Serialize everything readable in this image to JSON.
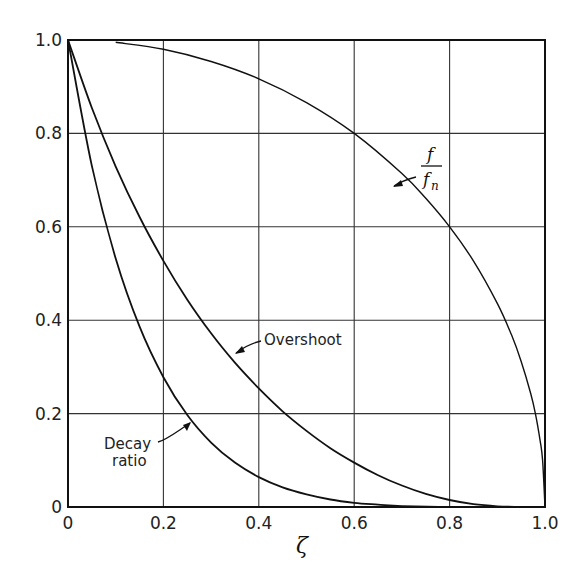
{
  "chart_data": {
    "type": "line",
    "title": "",
    "xlabel": "ζ",
    "ylabel": "",
    "xlim": [
      0,
      1.0
    ],
    "ylim": [
      0,
      1.0
    ],
    "grid": true,
    "x_ticks": [
      "0",
      "0.2",
      "0.4",
      "0.6",
      "0.8",
      "1.0"
    ],
    "y_ticks": [
      "0",
      "0.2",
      "0.4",
      "0.6",
      "0.8",
      "1.0"
    ],
    "series": [
      {
        "name": "f/f_n",
        "x": [
          0.1,
          0.2,
          0.3,
          0.4,
          0.5,
          0.6,
          0.7,
          0.75,
          0.8,
          0.85,
          0.9,
          0.93,
          0.95,
          0.97,
          0.98,
          0.99,
          0.995,
          1.0
        ],
        "values": [
          0.995,
          0.98,
          0.954,
          0.917,
          0.866,
          0.8,
          0.714,
          0.661,
          0.6,
          0.527,
          0.436,
          0.368,
          0.312,
          0.243,
          0.199,
          0.141,
          0.1,
          0.0
        ]
      },
      {
        "name": "Overshoot",
        "x": [
          0,
          0.05,
          0.1,
          0.15,
          0.2,
          0.25,
          0.3,
          0.35,
          0.4,
          0.45,
          0.5,
          0.55,
          0.6,
          0.65,
          0.7,
          0.75,
          0.8,
          0.85,
          0.9,
          0.95,
          1.0
        ],
        "values": [
          1.0,
          0.855,
          0.729,
          0.621,
          0.527,
          0.444,
          0.372,
          0.309,
          0.254,
          0.205,
          0.163,
          0.126,
          0.095,
          0.068,
          0.046,
          0.028,
          0.015,
          0.006,
          0.0015,
          0.0001,
          0.0
        ]
      },
      {
        "name": "Decay ratio",
        "x": [
          0,
          0.05,
          0.1,
          0.15,
          0.2,
          0.25,
          0.3,
          0.35,
          0.4,
          0.45,
          0.5,
          0.55,
          0.6,
          0.65,
          0.7,
          0.8,
          0.9,
          1.0
        ],
        "values": [
          1.0,
          0.731,
          0.532,
          0.386,
          0.278,
          0.197,
          0.138,
          0.095,
          0.064,
          0.042,
          0.027,
          0.016,
          0.009,
          0.005,
          0.002,
          0.0002,
          0.0,
          0.0
        ]
      }
    ],
    "annotations": [
      {
        "label": "f",
        "sub": "n",
        "target_series": "f/f_n",
        "at_x": 0.61
      },
      {
        "label": "Overshoot",
        "target_series": "Overshoot",
        "at_x": 0.36
      },
      {
        "label_lines": [
          "Decay",
          "ratio"
        ],
        "target_series": "Decay ratio",
        "at_x": 0.26
      }
    ]
  },
  "labels": {
    "x_axis": "ζ",
    "overshoot": "Overshoot",
    "decay_line1": "Decay",
    "decay_line2": "ratio",
    "ffn_num": "f",
    "ffn_den": "f",
    "ffn_sub": "n"
  }
}
